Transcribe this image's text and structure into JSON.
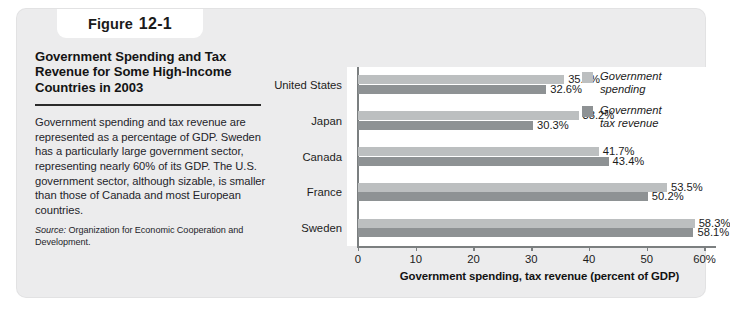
{
  "figure": {
    "label_word": "Figure",
    "number": "12-1",
    "title_lines": [
      "Government Spending and Tax",
      "Revenue for Some High-Income",
      "Countries in 2003"
    ],
    "caption": "Government spending and tax revenue are represented as a percentage of GDP. Sweden has a particularly large government sector, representing nearly 60% of its GDP. The U.S. government sector, although sizable, is smaller than those of Canada and most European countries.",
    "source_label": "Source:",
    "source_text": " Organization for Economic Cooperation and Development."
  },
  "chart_data": {
    "type": "bar",
    "orientation": "horizontal",
    "title": "Government Spending and Tax Revenue for Some High-Income Countries in 2003",
    "categories": [
      "United States",
      "Japan",
      "Canada",
      "France",
      "Sweden"
    ],
    "series": [
      {
        "name": "Government spending",
        "color": "#bcbfc0",
        "values": [
          35.7,
          38.2,
          41.7,
          53.5,
          58.3
        ],
        "labels": [
          "35.7%",
          "38.2%",
          "41.7%",
          "53.5%",
          "58.3%"
        ]
      },
      {
        "name": "Government tax revenue",
        "color": "#8e9294",
        "values": [
          32.6,
          30.3,
          43.4,
          50.2,
          58.1
        ],
        "labels": [
          "32.6%",
          "30.3%",
          "43.4%",
          "50.2%",
          "58.1%"
        ]
      }
    ],
    "xlabel": "Government spending, tax revenue (percent of GDP)",
    "ylabel": "",
    "xlim": [
      0,
      62
    ],
    "xticks": [
      0,
      10,
      20,
      30,
      40,
      50,
      60
    ],
    "xtick_labels": [
      "0",
      "10",
      "20",
      "30",
      "40",
      "50",
      "60%"
    ],
    "grid": false,
    "legend_position": "top-right",
    "legend_entries": [
      {
        "line1": "Government",
        "line2": "spending"
      },
      {
        "line1": "Government",
        "line2": "tax revenue"
      }
    ]
  }
}
